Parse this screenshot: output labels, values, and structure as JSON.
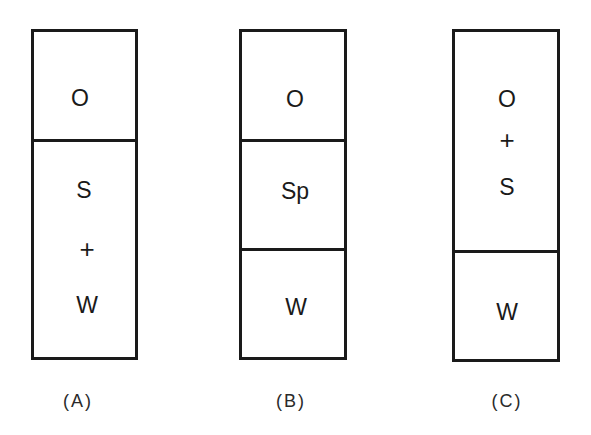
{
  "diagram": {
    "type": "layered-column-comparison",
    "colors": {
      "stroke": "#1a1a1a",
      "fill": "#ffffff",
      "text": "#1a1a1a"
    },
    "columns": [
      {
        "id": "A",
        "caption": "(A)",
        "layers": [
          {
            "labels": [
              "O"
            ]
          },
          {
            "labels": [
              "S",
              "+",
              "W"
            ]
          }
        ]
      },
      {
        "id": "B",
        "caption": "(B)",
        "layers": [
          {
            "labels": [
              "O"
            ]
          },
          {
            "labels": [
              "Sp"
            ]
          },
          {
            "labels": [
              "W"
            ]
          }
        ]
      },
      {
        "id": "C",
        "caption": "(C)",
        "layers": [
          {
            "labels": [
              "O",
              "+",
              "S"
            ]
          },
          {
            "labels": [
              "W"
            ]
          }
        ]
      }
    ]
  }
}
